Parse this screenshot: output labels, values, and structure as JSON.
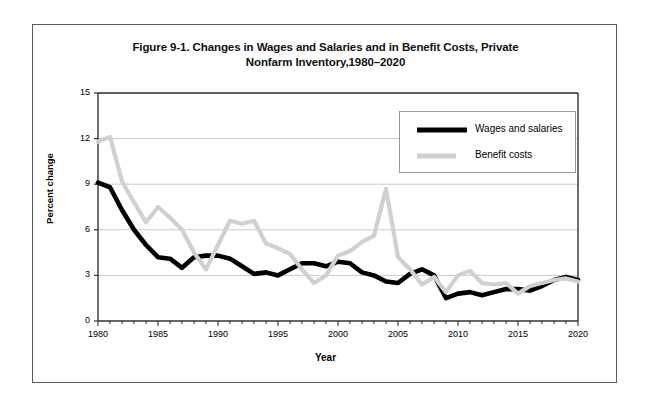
{
  "figure": {
    "title_line1": "Figure 9-1. Changes in Wages and Salaries and in Benefit Costs, Private",
    "title_line2": "Nonfarm Inventory,1980–2020"
  },
  "legend": {
    "position": "upper-right",
    "items": [
      {
        "label": "Wages and salaries",
        "color": "#000000",
        "swatch": "thick-black-line"
      },
      {
        "label": "Benefit costs",
        "color": "#d0d0d0",
        "swatch": "thick-gray-line"
      }
    ]
  },
  "chart_data": {
    "type": "line",
    "title": "Figure 9-1. Changes in Wages and Salaries and in Benefit Costs, Private Nonfarm Inventory,1980–2020",
    "xlabel": "Year",
    "ylabel": "Percent change",
    "xlim": [
      1980,
      2020
    ],
    "ylim": [
      0,
      15
    ],
    "ytick_labels": [
      "0",
      "3",
      "6",
      "9",
      "12",
      "15"
    ],
    "yticks": [
      0,
      3,
      6,
      9,
      12,
      15
    ],
    "xtick_labels": [
      "1980",
      "1985",
      "1990",
      "1995",
      "2000",
      "2005",
      "2010",
      "2015",
      "2020"
    ],
    "xticks": [
      1980,
      1985,
      1990,
      1995,
      2000,
      2005,
      2010,
      2015,
      2020
    ],
    "xtick_minor_interval": 1,
    "grid": "horizontal",
    "legend_position": "upper right",
    "x": [
      1980,
      1981,
      1982,
      1983,
      1984,
      1985,
      1986,
      1987,
      1988,
      1989,
      1990,
      1991,
      1992,
      1993,
      1994,
      1995,
      1996,
      1997,
      1998,
      1999,
      2000,
      2001,
      2002,
      2003,
      2004,
      2005,
      2006,
      2007,
      2008,
      2009,
      2010,
      2011,
      2012,
      2013,
      2014,
      2015,
      2016,
      2017,
      2018,
      2019,
      2020
    ],
    "series": [
      {
        "name": "Wages and salaries",
        "color": "#000000",
        "values": [
          9.1,
          8.8,
          7.3,
          6.0,
          5.0,
          4.2,
          4.1,
          3.5,
          4.2,
          4.3,
          4.3,
          4.1,
          3.6,
          3.1,
          3.2,
          3.0,
          3.4,
          3.8,
          3.8,
          3.6,
          3.9,
          3.8,
          3.2,
          3.0,
          2.6,
          2.5,
          3.1,
          3.4,
          3.0,
          1.5,
          1.8,
          1.9,
          1.7,
          1.9,
          2.1,
          2.1,
          2.0,
          2.3,
          2.7,
          2.9,
          2.7
        ]
      },
      {
        "name": "Benefit costs",
        "color": "#d0d0d0",
        "values": [
          11.8,
          12.1,
          9.2,
          7.8,
          6.5,
          7.5,
          6.8,
          6.0,
          4.5,
          3.4,
          5.0,
          6.6,
          6.4,
          6.6,
          5.1,
          4.8,
          4.4,
          3.4,
          2.5,
          3.0,
          4.3,
          4.6,
          5.2,
          5.6,
          8.7,
          4.2,
          3.4,
          2.4,
          2.9,
          1.9,
          3.0,
          3.3,
          2.5,
          2.4,
          2.5,
          1.8,
          2.3,
          2.5,
          2.7,
          2.8,
          2.6
        ]
      }
    ]
  }
}
